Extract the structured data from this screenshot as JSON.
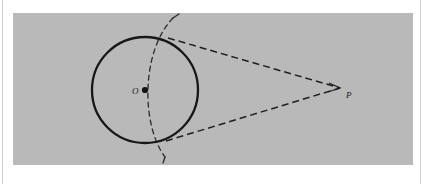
{
  "figure": {
    "kind": "geometry-diagram",
    "background_color": "#b9b9b9",
    "ink_color": "#1a1a1a",
    "page_color": "#ffffff",
    "labels": {
      "center": "O",
      "external_point": "P"
    },
    "elements": [
      {
        "name": "circle",
        "type": "circle",
        "style": "solid",
        "center": [
          132,
          77
        ],
        "radius": 53
      },
      {
        "name": "center-dot",
        "type": "point",
        "style": "filled",
        "at": [
          132,
          77
        ]
      },
      {
        "name": "external-point-P",
        "type": "point",
        "at": [
          327,
          75
        ]
      },
      {
        "name": "upper-tangent-line",
        "type": "segment",
        "style": "dashed",
        "from": [
          155,
          25
        ],
        "to": [
          327,
          75
        ]
      },
      {
        "name": "lower-tangent-line",
        "type": "segment",
        "style": "dashed",
        "from": [
          155,
          127
        ],
        "to": [
          327,
          75
        ]
      },
      {
        "name": "construction-arc",
        "type": "arc",
        "style": "dashed",
        "centered_on": "P",
        "through": [
          "upper-tangent-point",
          "O",
          "lower-tangent-point"
        ],
        "from": [
          160,
          5
        ],
        "to": [
          152,
          144
        ]
      },
      {
        "name": "upper-tangent-point",
        "type": "point",
        "at": [
          155,
          25
        ]
      },
      {
        "name": "lower-tangent-point",
        "type": "point",
        "at": [
          155,
          127
        ]
      }
    ]
  }
}
